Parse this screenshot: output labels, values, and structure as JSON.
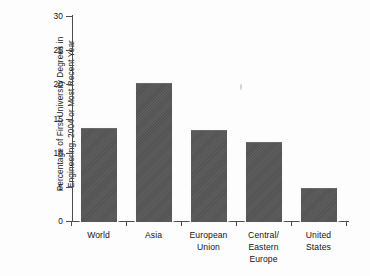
{
  "chart_data": {
    "type": "bar",
    "title": "",
    "xlabel": "",
    "ylabel": "Percentage of First University Degrees in Engineering, 2004 or Most Recent Year",
    "ylabel_lines": [
      "Percentage of First University Degrees in",
      "Engineering, 2004 or Most Recent Year"
    ],
    "categories": [
      "World",
      "Asia",
      "European Union",
      "Central/ Eastern Europe",
      "United States"
    ],
    "category_lines": [
      [
        "World"
      ],
      [
        "Asia"
      ],
      [
        "European",
        "Union"
      ],
      [
        "Central/",
        "Eastern",
        "Europe"
      ],
      [
        "United",
        "States"
      ]
    ],
    "values": [
      13.6,
      20.2,
      13.3,
      11.6,
      4.8
    ],
    "ylim": [
      0,
      30
    ],
    "yticks": [
      0,
      5,
      10,
      15,
      20,
      25,
      30
    ],
    "ytick_labels": [
      "0",
      "5",
      "10",
      "15",
      "20",
      "25",
      "30"
    ],
    "grid": false,
    "legend": "none",
    "bar_color": "#565656",
    "axis_color": "#4d4d4d",
    "background_color": "#fdfdfd"
  }
}
